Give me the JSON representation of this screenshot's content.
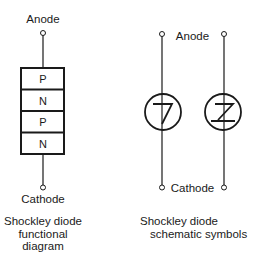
{
  "functional": {
    "anode_label": "Anode",
    "cathode_label": "Cathode",
    "layers": [
      "P",
      "N",
      "P",
      "N"
    ],
    "caption": [
      "Shockley diode",
      "functional",
      "diagram"
    ]
  },
  "schematic": {
    "anode_label": "Anode",
    "cathode_label": "Cathode",
    "caption": [
      "Shockley diode",
      "schematic symbols"
    ]
  }
}
